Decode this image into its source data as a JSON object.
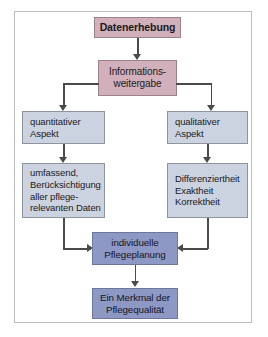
{
  "diagram": {
    "title_box": {
      "label": "Datenerhebung",
      "color": "#d2b0bb"
    },
    "second_box": {
      "label": "Informations-\nweitergabe",
      "color": "#d2b0bb"
    },
    "left_branch": {
      "aspect": {
        "label": "quantitativer\nAspekt",
        "color": "#ccd3e0"
      },
      "detail": {
        "label": "umfassend,\nBerücksichtigung\naller pflege-\nrelevanten Daten",
        "color": "#ccd3e0"
      }
    },
    "right_branch": {
      "aspect": {
        "label": "qualitativer\nAspekt",
        "color": "#ccd3e0"
      },
      "detail": {
        "label": "Differenziertheit\nExaktheit\nKorrektheit",
        "color": "#ccd3e0"
      }
    },
    "merge_box": {
      "label": "individuelle\nPflegeplanung",
      "color": "#8e98c4"
    },
    "result_box": {
      "label": "Ein Merkmal der\nPflegequalität",
      "color": "#8e98c4"
    }
  }
}
